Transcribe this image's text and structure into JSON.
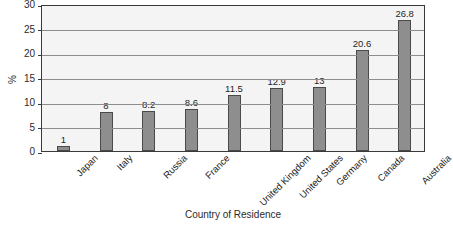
{
  "chart_data": {
    "type": "bar",
    "title": "",
    "xlabel": "Country of Residence",
    "ylabel": "%",
    "ylim": [
      0,
      30
    ],
    "ytick_step": 5,
    "yticks": [
      30,
      25,
      20,
      15,
      10,
      5,
      0
    ],
    "grid": true,
    "legend": "none",
    "categories": [
      "Japan",
      "Italy",
      "Russia",
      "France",
      "United Kingdom",
      "United States",
      "Germany",
      "Canada",
      "Australia"
    ],
    "values": [
      1,
      8,
      8.2,
      8.6,
      11.5,
      12.9,
      13,
      20.6,
      26.8
    ],
    "value_labels": [
      "1",
      "8",
      "8.2",
      "8.6",
      "11.5",
      "12.9",
      "13",
      "20.6",
      "26.8"
    ],
    "colors": {
      "bar_fill": "#8e8e8e",
      "bar_stroke": "#4a4a4a",
      "plot_background": "#f4f4f4",
      "gridline": "#8d8d8d",
      "axis": "#3a3a3a",
      "text": "#1f1f1f",
      "page_background": "#ffffff"
    }
  }
}
